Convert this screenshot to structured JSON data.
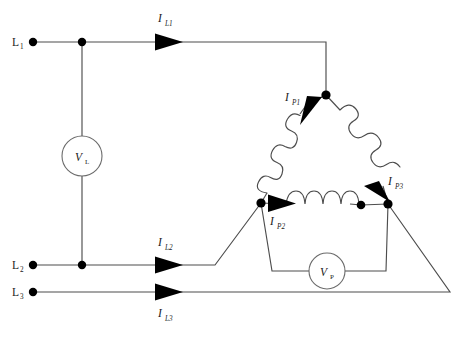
{
  "diagram": {
    "type": "electrical-circuit-schematic",
    "stroke_color": "#4d4d4d",
    "node_color": "#000000",
    "background": "#ffffff",
    "terminals": [
      {
        "id": "L1",
        "main": "L",
        "sub": "1",
        "x": 18,
        "y": 42
      },
      {
        "id": "L2",
        "main": "L",
        "sub": "2",
        "x": 18,
        "y": 265
      },
      {
        "id": "L3",
        "main": "L",
        "sub": "3",
        "x": 18,
        "y": 292
      }
    ],
    "line_currents": [
      {
        "id": "IL1",
        "main": "I",
        "sub": "L1",
        "x": 160,
        "y": 22
      },
      {
        "id": "IL2",
        "main": "I",
        "sub": "L2",
        "x": 160,
        "y": 246
      },
      {
        "id": "IL3",
        "main": "I",
        "sub": "L3",
        "x": 160,
        "y": 315
      }
    ],
    "phase_currents": [
      {
        "id": "IP1",
        "main": "I",
        "sub": "P1",
        "x": 287,
        "y": 100
      },
      {
        "id": "IP2",
        "main": "I",
        "sub": "P2",
        "x": 272,
        "y": 224
      },
      {
        "id": "IP3",
        "main": "I",
        "sub": "P3",
        "x": 389,
        "y": 184
      }
    ],
    "meters": [
      {
        "id": "VL",
        "main": "V",
        "sub": "L",
        "cx": 82,
        "cy": 156,
        "r": 20
      },
      {
        "id": "VP",
        "main": "V",
        "sub": "P",
        "cx": 327,
        "cy": 271,
        "r": 18
      }
    ],
    "nodes": [
      {
        "id": "term-dot-L1",
        "x": 33,
        "y": 42,
        "r": 4.2
      },
      {
        "id": "junction-L1",
        "x": 82,
        "y": 42,
        "r": 4.2
      },
      {
        "id": "term-dot-L2",
        "x": 33,
        "y": 265,
        "r": 4.2
      },
      {
        "id": "junction-L2",
        "x": 82,
        "y": 265,
        "r": 4.2
      },
      {
        "id": "term-dot-L3",
        "x": 33,
        "y": 292,
        "r": 4.2
      },
      {
        "id": "delta-apex-top",
        "x": 326,
        "y": 95,
        "r": 4.6
      },
      {
        "id": "delta-vertex-left",
        "x": 261,
        "y": 203,
        "r": 4.6
      },
      {
        "id": "delta-coil-end-right",
        "x": 361,
        "y": 205,
        "r": 4.3
      },
      {
        "id": "delta-vertex-right",
        "x": 388,
        "y": 204,
        "r": 4.6
      }
    ]
  }
}
